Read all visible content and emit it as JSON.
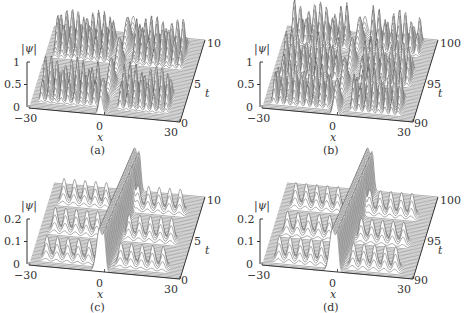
{
  "figure": {
    "panels": [
      {
        "id": "a",
        "caption": "(a)",
        "zlabel": "|ψ|",
        "xlabel": "x",
        "tlabel": "t",
        "zticks": [
          "0",
          "0.5",
          "1"
        ],
        "xticks": [
          "−30",
          "0",
          "30"
        ],
        "tticks": [
          "0",
          "5",
          "10"
        ]
      },
      {
        "id": "b",
        "caption": "(b)",
        "zlabel": "|ψ|",
        "xlabel": "x",
        "tlabel": "t",
        "zticks": [
          "0",
          "0.5",
          "1"
        ],
        "xticks": [
          "−30",
          "0",
          "30"
        ],
        "tticks": [
          "90",
          "95",
          "100"
        ]
      },
      {
        "id": "c",
        "caption": "(c)",
        "zlabel": "|ψ|",
        "xlabel": "x",
        "tlabel": "t",
        "zticks": [
          "0",
          "0.1",
          "0.2"
        ],
        "xticks": [
          "−30",
          "0",
          "30"
        ],
        "tticks": [
          "0",
          "5",
          "10"
        ]
      },
      {
        "id": "d",
        "caption": "(d)",
        "zlabel": "|ψ|",
        "xlabel": "x",
        "tlabel": "t",
        "zticks": [
          "0",
          "0.1",
          "0.2"
        ],
        "xticks": [
          "−30",
          "0",
          "30"
        ],
        "tticks": [
          "90",
          "95",
          "100"
        ]
      }
    ]
  },
  "chart_data": [
    {
      "type": "surface",
      "title": "(a)",
      "xlabel": "x",
      "ylabel": "t",
      "zlabel": "|ψ|",
      "xlim": [
        -30,
        30
      ],
      "tlim": [
        0,
        10
      ],
      "zlim": [
        0,
        1
      ],
      "description": "Waterfall plot: central peak near x=0 with oscillating breather-like trains of peaks on both sides, amplitude up to ~1",
      "peaks": {
        "central_x": 0,
        "side_peak_amplitude": 0.9,
        "side_peak_regions": [
          [
            -25,
            -5
          ],
          [
            5,
            25
          ]
        ]
      }
    },
    {
      "type": "surface",
      "title": "(b)",
      "xlabel": "x",
      "ylabel": "t",
      "zlabel": "|ψ|",
      "xlim": [
        -30,
        30
      ],
      "tlim": [
        90,
        100
      ],
      "zlim": [
        0,
        1
      ],
      "description": "Waterfall plot at later time: irregular trains of peaks on both sides of a central structure, amplitude up to ~1"
    },
    {
      "type": "surface",
      "title": "(c)",
      "xlabel": "x",
      "ylabel": "t",
      "zlabel": "|ψ|",
      "xlim": [
        -30,
        30
      ],
      "tlim": [
        0,
        10
      ],
      "zlim": [
        0,
        0.2
      ],
      "description": "Waterfall plot: tall narrow central structure near x=0 with periodic small isolated peaks (~0.1) on both sides"
    },
    {
      "type": "surface",
      "title": "(d)",
      "xlabel": "x",
      "ylabel": "t",
      "zlabel": "|ψ|",
      "xlim": [
        -30,
        30
      ],
      "tlim": [
        90,
        100
      ],
      "zlim": [
        0,
        0.2
      ],
      "description": "Waterfall plot at later time: dense central ridge near x=0 with periodic small peaks (~0.1) on both sides"
    }
  ]
}
